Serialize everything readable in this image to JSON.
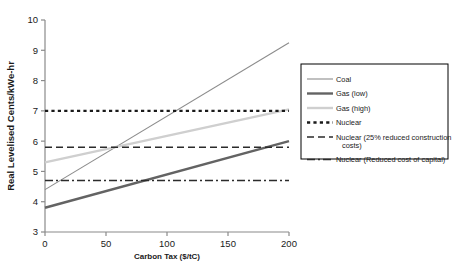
{
  "chart_data": {
    "type": "line",
    "title": "",
    "xlabel": "Carbon Tax ($/tC)",
    "ylabel": "Real Levelised Cents/kWe-hr",
    "xlim": [
      0,
      200
    ],
    "ylim": [
      3,
      10
    ],
    "xticks": [
      0,
      50,
      100,
      150,
      200
    ],
    "yticks": [
      3,
      4,
      5,
      6,
      7,
      8,
      9,
      10
    ],
    "grid": false,
    "legend_position": "right",
    "x": [
      0,
      200
    ],
    "series": [
      {
        "name": "Coal",
        "values": [
          4.4,
          9.25
        ],
        "style": "solid",
        "color": "#8c8c8c",
        "width": 1.1
      },
      {
        "name": "Gas (low)",
        "values": [
          3.8,
          6.0
        ],
        "style": "solid",
        "color": "#636363",
        "width": 2.4
      },
      {
        "name": "Gas (high)",
        "values": [
          5.3,
          7.05
        ],
        "style": "solid",
        "color": "#cfcfcf",
        "width": 2.4
      },
      {
        "name": "Nuclear",
        "values": [
          7.0,
          7.0
        ],
        "style": "dotted",
        "color": "#1a1a1a",
        "width": 2.4
      },
      {
        "name": "Nuclear (25% reduced construction costs)",
        "values": [
          5.8,
          5.8
        ],
        "style": "dashed",
        "color": "#2b2b2b",
        "width": 1.6
      },
      {
        "name": "Nuclear (Reduced cost of capital)",
        "values": [
          4.7,
          4.7
        ],
        "style": "dashdot",
        "color": "#2b2b2b",
        "width": 1.3
      }
    ]
  },
  "axes": {
    "y_title": "Real Levelised Cents/kWe-hr",
    "x_title": "Carbon Tax ($/tC)",
    "y_tick_labels": [
      "10",
      "9",
      "8",
      "7",
      "6",
      "5",
      "4",
      "3"
    ],
    "x_tick_labels": [
      "0",
      "50",
      "100",
      "150",
      "200"
    ]
  },
  "legend": {
    "entries": [
      {
        "label": "Coal"
      },
      {
        "label": "Gas (low)"
      },
      {
        "label": "Gas (high)"
      },
      {
        "label": "Nuclear"
      },
      {
        "label": "Nuclear (25% reduced construction"
      },
      {
        "label": "costs)"
      },
      {
        "label": "Nuclear (Reduced cost of capital)"
      }
    ]
  },
  "colors": {
    "axis": "#8a8a8a",
    "text": "#1a1a1a",
    "legend_border": "#000000",
    "background": "#ffffff"
  }
}
